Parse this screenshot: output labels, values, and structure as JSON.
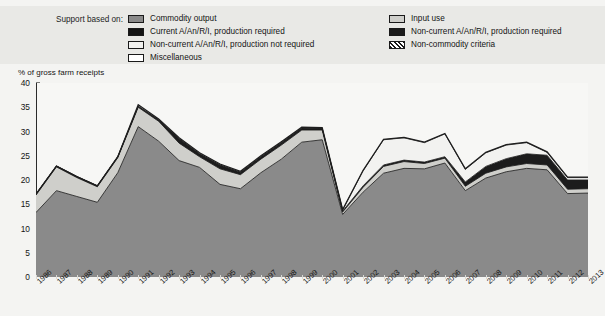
{
  "legend": {
    "title": "Support based on:",
    "left_column": [
      {
        "label": "Commodity output",
        "color": "#8a8a8a",
        "pattern": "solid"
      },
      {
        "label": "Current A/An/R/I, production required",
        "color": "#141414",
        "pattern": "solid"
      },
      {
        "label": "Non-current A/An/R/I, production not required",
        "color": "#f2f2f0",
        "pattern": "solid"
      },
      {
        "label": "Miscellaneous",
        "color": "#ffffff",
        "pattern": "solid"
      }
    ],
    "right_column": [
      {
        "label": "Input use",
        "color": "#cfcfcb",
        "pattern": "solid"
      },
      {
        "label": "Non-current A/An/R/I, production required",
        "color": "#1c1c1c",
        "pattern": "solid"
      },
      {
        "label": "Non-commodity criteria",
        "color": "#b5b5b0",
        "pattern": "hatch"
      }
    ]
  },
  "chart_data": {
    "type": "area",
    "stacked": true,
    "title": "",
    "xlabel": "",
    "ylabel": "% of gross farm receipts",
    "ylim": [
      0,
      40
    ],
    "yticks": [
      0,
      5,
      10,
      15,
      20,
      25,
      30,
      35,
      40
    ],
    "grid": false,
    "legend_position": "top",
    "categories": [
      "1986",
      "1987",
      "1988",
      "1989",
      "1990",
      "1991",
      "1992",
      "1993",
      "1994",
      "1995",
      "1996",
      "1997",
      "1998",
      "1999",
      "2000",
      "2001",
      "2002",
      "2003",
      "2004",
      "2005",
      "2006",
      "2007",
      "2008",
      "2009",
      "2010",
      "2011",
      "2012",
      "2013"
    ],
    "series": [
      {
        "name": "Commodity output",
        "color": "#8a8a8a",
        "values": [
          13.3,
          17.8,
          16.6,
          15.4,
          21.5,
          31.0,
          28.0,
          24.0,
          22.6,
          19.1,
          18.2,
          21.5,
          24.3,
          27.8,
          28.3,
          12.9,
          17.5,
          21.4,
          22.4,
          22.3,
          23.5,
          17.8,
          20.4,
          21.7,
          22.4,
          22.1,
          17.2,
          17.3
        ]
      },
      {
        "name": "Input use",
        "color": "#cfcfcb",
        "values": [
          3.6,
          4.9,
          3.9,
          3.2,
          3.1,
          4.0,
          4.1,
          3.6,
          2.2,
          3.2,
          2.9,
          2.8,
          2.9,
          2.5,
          2.0,
          0.5,
          1.0,
          1.4,
          1.4,
          1.1,
          1.0,
          0.9,
          1.0,
          1.0,
          1.0,
          1.0,
          0.9,
          0.9
        ]
      },
      {
        "name": "Non-current A/An/R/I, production required",
        "color": "#1c1c1c",
        "values": [
          0.2,
          0.2,
          0.2,
          0.2,
          0.2,
          0.2,
          0.3,
          0.9,
          0.6,
          0.8,
          0.5,
          0.5,
          0.5,
          0.4,
          0.3,
          0.2,
          0.3,
          0.3,
          0.3,
          0.3,
          0.3,
          0.9,
          1.4,
          1.7,
          2.0,
          2.0,
          1.9,
          1.8
        ]
      },
      {
        "name": "Non-current A/An/R/I, production not required",
        "color": "#f2f2f0",
        "values": [
          0.0,
          0.0,
          0.0,
          0.0,
          0.0,
          0.0,
          0.0,
          0.0,
          0.0,
          0.0,
          0.0,
          0.0,
          0.0,
          0.0,
          0.0,
          0.2,
          3.1,
          5.2,
          4.6,
          4.0,
          4.7,
          2.6,
          2.8,
          2.8,
          2.3,
          0.6,
          0.5,
          0.5
        ]
      },
      {
        "name": "Miscellaneous",
        "color": "#ffffff",
        "values": [
          0.0,
          0.0,
          0.0,
          0.0,
          0.0,
          0.3,
          0.2,
          0.2,
          0.2,
          0.2,
          0.2,
          0.2,
          0.2,
          0.2,
          0.2,
          0.1,
          0.1,
          0.1,
          0.1,
          0.1,
          0.1,
          0.1,
          0.1,
          0.1,
          0.1,
          0.1,
          0.1,
          0.1
        ]
      }
    ],
    "totals": [
      17.1,
      22.9,
      20.7,
      18.8,
      24.8,
      35.5,
      32.6,
      28.7,
      25.6,
      23.3,
      21.8,
      25.0,
      27.9,
      30.9,
      30.8,
      13.9,
      22.0,
      28.4,
      28.8,
      27.8,
      29.6,
      22.3,
      25.7,
      27.3,
      27.8,
      25.8,
      20.6,
      20.6
    ]
  }
}
